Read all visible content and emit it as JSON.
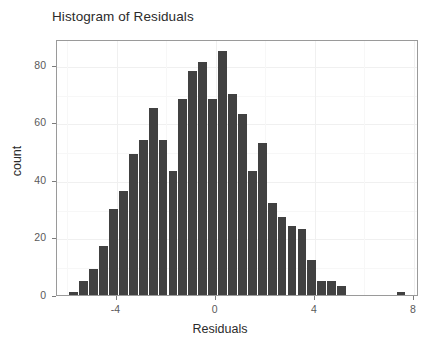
{
  "chart_data": {
    "type": "bar",
    "title": "Histogram of Residuals",
    "xlabel": "Residuals",
    "ylabel": "count",
    "xlim": [
      -6.4,
      8.2
    ],
    "ylim": [
      0,
      89
    ],
    "grid": true,
    "legend": null,
    "bin_width": 0.4,
    "bar_color": "#414141",
    "panel_border_color": "#9a9a9a",
    "grid_color": "#f0f0f0",
    "background": "#ffffff",
    "xticks": [
      -4,
      0,
      4,
      8
    ],
    "xtick_labels": [
      "-4",
      "0",
      "4",
      "8"
    ],
    "yticks": [
      0,
      20,
      40,
      60,
      80
    ],
    "ytick_labels": [
      "0",
      "20",
      "40",
      "60",
      "80"
    ],
    "x_minor_ticks": [
      -6,
      -2,
      2,
      6
    ],
    "y_minor_ticks": [
      10,
      30,
      50,
      70
    ],
    "bin_centers": [
      -5.7,
      -5.3,
      -4.9,
      -4.5,
      -4.1,
      -3.7,
      -3.3,
      -2.9,
      -2.5,
      -2.1,
      -1.7,
      -1.3,
      -0.9,
      -0.5,
      -0.1,
      0.3,
      0.7,
      1.1,
      1.5,
      1.9,
      2.3,
      2.7,
      3.1,
      3.5,
      3.9,
      4.3,
      4.7,
      5.1,
      5.5,
      5.9,
      6.3,
      7.5
    ],
    "values": [
      1,
      5,
      9,
      17,
      30,
      36,
      49,
      54,
      65,
      54,
      43,
      68,
      78,
      81,
      68,
      85,
      70,
      63,
      43,
      53,
      32,
      27,
      24,
      23,
      12,
      5,
      5,
      3,
      1,
      0,
      0,
      1
    ],
    "bars": [
      {
        "center": -5.7,
        "count": 1
      },
      {
        "center": -5.3,
        "count": 5
      },
      {
        "center": -4.9,
        "count": 9
      },
      {
        "center": -4.5,
        "count": 17
      },
      {
        "center": -4.1,
        "count": 30
      },
      {
        "center": -3.7,
        "count": 36
      },
      {
        "center": -3.3,
        "count": 49
      },
      {
        "center": -2.9,
        "count": 54
      },
      {
        "center": -2.5,
        "count": 65
      },
      {
        "center": -2.1,
        "count": 54
      },
      {
        "center": -1.7,
        "count": 43
      },
      {
        "center": -1.3,
        "count": 68
      },
      {
        "center": -0.9,
        "count": 78
      },
      {
        "center": -0.5,
        "count": 81
      },
      {
        "center": -0.1,
        "count": 68
      },
      {
        "center": 0.3,
        "count": 85
      },
      {
        "center": 0.7,
        "count": 70
      },
      {
        "center": 1.1,
        "count": 63
      },
      {
        "center": 1.5,
        "count": 43
      },
      {
        "center": 1.9,
        "count": 53
      },
      {
        "center": 2.3,
        "count": 32
      },
      {
        "center": 2.7,
        "count": 27
      },
      {
        "center": 3.1,
        "count": 24
      },
      {
        "center": 3.5,
        "count": 23
      },
      {
        "center": 3.9,
        "count": 12
      },
      {
        "center": 4.3,
        "count": 5
      },
      {
        "center": 4.7,
        "count": 5
      },
      {
        "center": 5.1,
        "count": 3
      },
      {
        "center": 7.5,
        "count": 1
      }
    ]
  }
}
